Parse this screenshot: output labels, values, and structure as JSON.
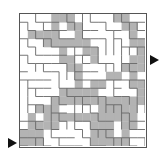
{
  "puzzle": {
    "type": "maze",
    "grid": {
      "cols": 16,
      "rows": 16
    },
    "entrance": {
      "side": "left",
      "row": 15,
      "label": "start-arrow"
    },
    "exit": {
      "side": "right",
      "row": 5,
      "label": "end-arrow"
    },
    "colors": {
      "wall": "#666666",
      "path": "#b3b3b3",
      "background": "#ffffff",
      "border": "#555555",
      "arrow": "#111111"
    },
    "solution_path_cells": [
      [
        15,
        0
      ],
      [
        15,
        1
      ],
      [
        15,
        2
      ],
      [
        14,
        2
      ],
      [
        13,
        2
      ],
      [
        13,
        3
      ],
      [
        12,
        3
      ],
      [
        11,
        3
      ],
      [
        11,
        4
      ],
      [
        10,
        4
      ],
      [
        10,
        5
      ],
      [
        10,
        6
      ],
      [
        10,
        7
      ],
      [
        10,
        8
      ],
      [
        10,
        9
      ],
      [
        10,
        10
      ],
      [
        11,
        10
      ],
      [
        11,
        11
      ],
      [
        12,
        11
      ],
      [
        13,
        11
      ],
      [
        14,
        11
      ],
      [
        15,
        11
      ],
      [
        15,
        12
      ],
      [
        15,
        13
      ],
      [
        14,
        13
      ],
      [
        13,
        13
      ],
      [
        13,
        14
      ],
      [
        12,
        14
      ],
      [
        11,
        14
      ],
      [
        10,
        14
      ],
      [
        10,
        15
      ],
      [
        9,
        15
      ],
      [
        8,
        15
      ],
      [
        8,
        14
      ],
      [
        7,
        14
      ],
      [
        6,
        14
      ],
      [
        6,
        15
      ],
      [
        5,
        15
      ]
    ],
    "shaded_regions": [
      [
        0,
        4
      ],
      [
        0,
        5
      ],
      [
        0,
        6
      ],
      [
        1,
        4
      ],
      [
        1,
        6
      ],
      [
        1,
        7
      ],
      [
        2,
        1
      ],
      [
        2,
        2
      ],
      [
        2,
        3
      ],
      [
        2,
        4
      ],
      [
        2,
        7
      ],
      [
        3,
        3
      ],
      [
        3,
        4
      ],
      [
        3,
        5
      ],
      [
        3,
        6
      ],
      [
        3,
        7
      ],
      [
        3,
        8
      ],
      [
        4,
        5
      ],
      [
        4,
        8
      ],
      [
        4,
        9
      ],
      [
        5,
        5
      ],
      [
        5,
        6
      ],
      [
        5,
        9
      ],
      [
        6,
        6
      ],
      [
        6,
        7
      ],
      [
        7,
        7
      ],
      [
        8,
        7
      ],
      [
        9,
        7
      ],
      [
        9,
        6
      ],
      [
        9,
        5
      ],
      [
        0,
        12
      ],
      [
        0,
        13
      ],
      [
        1,
        13
      ],
      [
        1,
        14
      ],
      [
        2,
        14
      ],
      [
        3,
        14
      ],
      [
        3,
        15
      ],
      [
        4,
        15
      ],
      [
        5,
        14
      ],
      [
        6,
        13
      ],
      [
        7,
        12
      ],
      [
        7,
        11
      ],
      [
        8,
        10
      ],
      [
        8,
        9
      ],
      [
        9,
        9
      ],
      [
        9,
        8
      ],
      [
        10,
        11
      ],
      [
        10,
        12
      ],
      [
        10,
        13
      ],
      [
        11,
        12
      ],
      [
        11,
        13
      ],
      [
        12,
        12
      ],
      [
        12,
        13
      ],
      [
        12,
        4
      ],
      [
        12,
        5
      ],
      [
        12,
        6
      ],
      [
        12,
        7
      ],
      [
        12,
        8
      ],
      [
        12,
        9
      ],
      [
        12,
        10
      ],
      [
        13,
        4
      ],
      [
        13,
        9
      ],
      [
        13,
        10
      ],
      [
        14,
        9
      ],
      [
        14,
        10
      ],
      [
        14,
        1
      ],
      [
        14,
        0
      ],
      [
        13,
        1
      ],
      [
        12,
        1
      ],
      [
        11,
        2
      ],
      [
        15,
        9
      ],
      [
        15,
        10
      ]
    ]
  }
}
